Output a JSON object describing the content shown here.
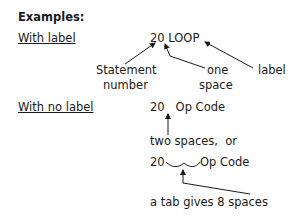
{
  "heading": "Examples:",
  "with_label": {
    "title": "With label",
    "code": "20 LOOP",
    "annotations": {
      "statement_number_line1": "Statement",
      "statement_number_line2": "number",
      "one_space_line1": "one",
      "one_space_line2": "space",
      "label": "label"
    }
  },
  "with_no_label": {
    "title": "With no label",
    "code": "20   Op Code",
    "note_two_spaces": "two spaces,  or",
    "tab_prefix": "20",
    "tab_suffix": "Op Code",
    "note_tab": "a tab gives 8 spaces"
  }
}
